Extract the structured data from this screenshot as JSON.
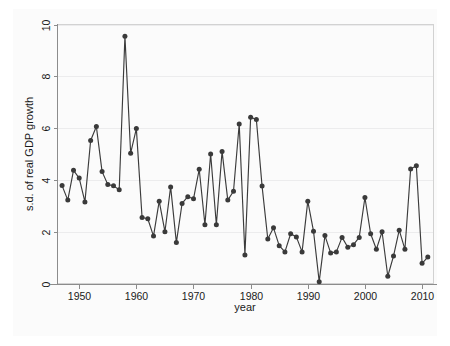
{
  "chart_data": {
    "type": "line",
    "title": "",
    "subtitle": "",
    "xlabel": "year",
    "ylabel": "s.d. of real GDP growth",
    "xlim": [
      1946.2,
      2012.0
    ],
    "ylim": [
      0,
      10
    ],
    "xticks": [
      1950,
      1960,
      1970,
      1980,
      1990,
      2000,
      2010
    ],
    "xtick_labels": [
      "1950",
      "1960",
      "1970",
      "1980",
      "1990",
      "2000",
      "2010"
    ],
    "yticks": [
      0,
      2,
      4,
      6,
      8,
      10
    ],
    "ytick_labels": [
      "0",
      "2",
      "4",
      "6",
      "8",
      "10"
    ],
    "grid": "horizontal",
    "legend": "none",
    "marker": "filled-circle",
    "line_color": "#3b3b3b",
    "marker_color": "#3a3a3a",
    "background_color": "#fbfbfb",
    "gridline_color": "#ececed",
    "x": [
      1947,
      1948,
      1949,
      1950,
      1951,
      1952,
      1953,
      1954,
      1955,
      1956,
      1957,
      1958,
      1959,
      1960,
      1961,
      1962,
      1963,
      1964,
      1965,
      1966,
      1967,
      1968,
      1969,
      1970,
      1971,
      1972,
      1973,
      1974,
      1975,
      1976,
      1977,
      1978,
      1979,
      1980,
      1981,
      1982,
      1983,
      1984,
      1985,
      1986,
      1987,
      1988,
      1989,
      1990,
      1991,
      1992,
      1993,
      1994,
      1995,
      1996,
      1997,
      1998,
      1999,
      2000,
      2001,
      2002,
      2003,
      2004,
      2005,
      2006,
      2007,
      2008,
      2009,
      2010,
      2011
    ],
    "series": [
      {
        "name": "s.d. of real GDP growth",
        "values": [
          3.78,
          3.22,
          4.37,
          4.07,
          3.15,
          5.52,
          6.06,
          4.32,
          3.82,
          3.77,
          3.62,
          9.55,
          5.03,
          5.98,
          2.55,
          2.5,
          1.83,
          3.18,
          2.0,
          3.73,
          1.58,
          3.09,
          3.35,
          3.27,
          4.41,
          2.27,
          5.0,
          2.27,
          5.1,
          3.22,
          3.56,
          6.16,
          1.1,
          6.42,
          6.33,
          3.76,
          1.72,
          2.15,
          1.46,
          1.22,
          1.92,
          1.8,
          1.22,
          3.18,
          2.02,
          0.07,
          1.85,
          1.18,
          1.22,
          1.78,
          1.4,
          1.5,
          1.78,
          3.32,
          1.92,
          1.32,
          2.0,
          0.28,
          1.06,
          2.06,
          1.32,
          4.42,
          4.55,
          0.78,
          1.02
        ]
      }
    ]
  },
  "axes": {
    "x_title": "year",
    "y_title": "s.d. of real GDP growth"
  }
}
